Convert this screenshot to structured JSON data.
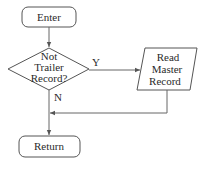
{
  "diagram": {
    "type": "flowchart",
    "nodes": {
      "enter": {
        "shape": "terminator",
        "label": "Enter"
      },
      "decision": {
        "shape": "diamond",
        "lines": [
          "Not",
          "Trailer",
          "Record?"
        ]
      },
      "read": {
        "shape": "parallelogram",
        "lines": [
          "Read",
          "Master",
          "Record"
        ]
      },
      "return": {
        "shape": "terminator",
        "label": "Return"
      }
    },
    "edges": [
      {
        "from": "enter",
        "to": "decision",
        "label": ""
      },
      {
        "from": "decision",
        "to": "read",
        "label": "Y"
      },
      {
        "from": "decision",
        "to": "return",
        "label": "N"
      },
      {
        "from": "read",
        "to": "return",
        "label": ""
      }
    ],
    "colors": {
      "stroke": "#555555",
      "background": "#ffffff",
      "text": "#2a2a2a"
    }
  }
}
